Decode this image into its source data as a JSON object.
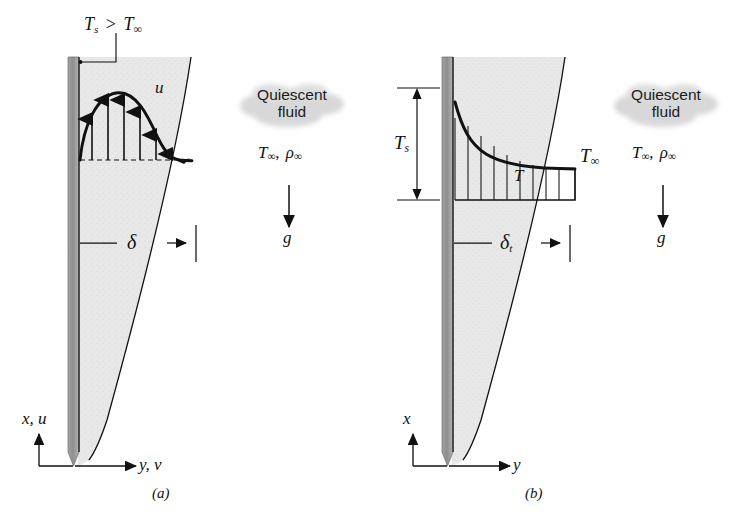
{
  "figure": {
    "title_visible": false,
    "background": "#ffffff",
    "ink": "#111111",
    "wall_dark": "#8c8c8c",
    "wall_mid": "#a8a8a8",
    "fluid_fill": "#e9e9e9",
    "cloud_fill": "#d6d6d6"
  },
  "panels": [
    {
      "id": "a",
      "caption": "(a)",
      "surface_condition": {
        "T_s": "T",
        "T_s_sub": "s",
        "relation": ">",
        "T_inf": "T",
        "T_inf_sub": "∞",
        "full": "Ts > T∞"
      },
      "profile_label": {
        "symbol": "u",
        "meaning": "velocity-profile"
      },
      "boundary_layer_label": {
        "symbol": "δ",
        "sub": "",
        "meaning": "velocity-boundary-layer-thickness"
      },
      "ambient_block": {
        "cloud_line1": "Quiescent",
        "cloud_line2": "fluid",
        "properties_T": "T",
        "properties_T_sub": "∞",
        "properties_sep": ",",
        "properties_rho": "ρ",
        "properties_rho_sub": "∞",
        "gravity_symbol": "g"
      },
      "axes": {
        "vertical": "x, u",
        "horizontal": "y, v"
      }
    },
    {
      "id": "b",
      "caption": "(b)",
      "wall_temperature": {
        "symbol": "T",
        "sub": "s"
      },
      "free_stream_temperature": {
        "symbol": "T",
        "sub": "∞"
      },
      "profile_label": {
        "symbol": "T",
        "meaning": "temperature-profile"
      },
      "boundary_layer_label": {
        "symbol": "δ",
        "sub": "t",
        "meaning": "thermal-boundary-layer-thickness"
      },
      "ambient_block": {
        "cloud_line1": "Quiescent",
        "cloud_line2": "fluid",
        "properties_T": "T",
        "properties_T_sub": "∞",
        "properties_sep": ",",
        "properties_rho": "ρ",
        "properties_rho_sub": "∞",
        "gravity_symbol": "g"
      },
      "axes": {
        "vertical": "x",
        "horizontal": "y"
      }
    }
  ]
}
